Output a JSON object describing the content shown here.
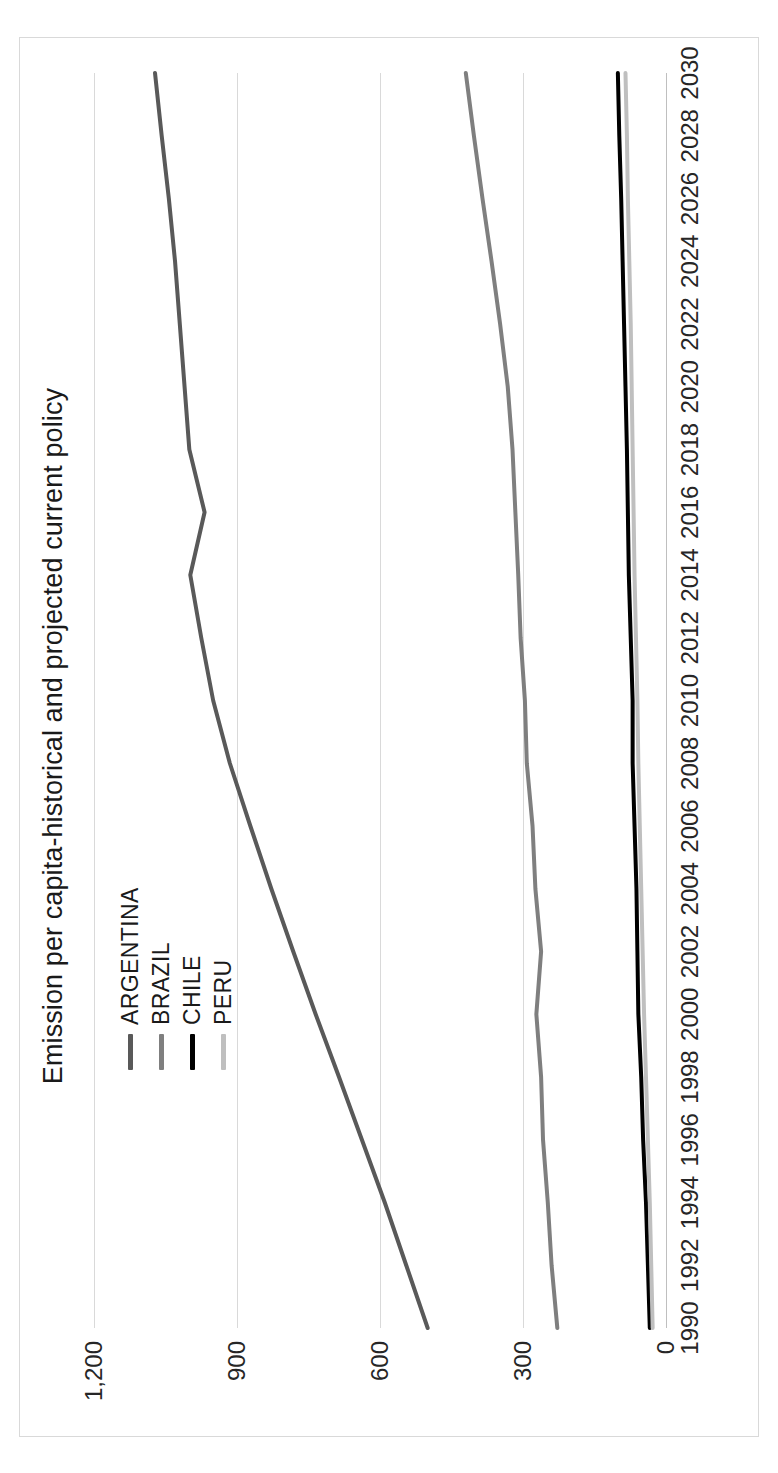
{
  "chart_data": {
    "type": "line",
    "title": "Emission per capita-historical and projected current policy",
    "xlabel": "",
    "ylabel": "",
    "xlim": [
      1990,
      2030
    ],
    "ylim": [
      0,
      1200
    ],
    "grid": true,
    "legend_position": "inside-upper-left",
    "y_ticks": [
      "0",
      "300",
      "600",
      "900",
      "1,200"
    ],
    "y_tick_values": [
      0,
      300,
      600,
      900,
      1200
    ],
    "x_ticks": [
      "1990",
      "1992",
      "1994",
      "1996",
      "1998",
      "2000",
      "2002",
      "2004",
      "2006",
      "2008",
      "2010",
      "2012",
      "2014",
      "2016",
      "2018",
      "2020",
      "2022",
      "2024",
      "2026",
      "2028",
      "2030"
    ],
    "x": [
      1990,
      1992,
      1994,
      1996,
      1998,
      2000,
      2002,
      2004,
      2006,
      2008,
      2010,
      2012,
      2014,
      2016,
      2018,
      2020,
      2022,
      2024,
      2026,
      2028,
      2030
    ],
    "colors": {
      "argentina": "#595959",
      "brazil": "#7f7f7f",
      "chile": "#000000",
      "peru": "#bfbfbf"
    },
    "series": [
      {
        "name": "ARGENTINA",
        "color": "#595959",
        "width": 4,
        "values": [
          500,
          545,
          590,
          638,
          686,
          735,
          782,
          828,
          872,
          915,
          950,
          975,
          998,
          968,
          1000,
          1010,
          1020,
          1030,
          1043,
          1058,
          1072
        ]
      },
      {
        "name": "BRAZIL",
        "color": "#7f7f7f",
        "width": 4,
        "values": [
          228,
          240,
          248,
          258,
          262,
          272,
          262,
          274,
          280,
          292,
          296,
          305,
          310,
          316,
          322,
          332,
          348,
          366,
          385,
          403,
          420
        ]
      },
      {
        "name": "CHILE",
        "color": "#000000",
        "width": 4,
        "values": [
          34,
          38,
          42,
          48,
          52,
          58,
          60,
          62,
          66,
          70,
          70,
          74,
          78,
          80,
          82,
          85,
          88,
          91,
          94,
          98,
          101
        ]
      },
      {
        "name": "PERU",
        "color": "#bfbfbf",
        "width": 4,
        "values": [
          28,
          31,
          34,
          38,
          42,
          46,
          49,
          52,
          55,
          58,
          60,
          63,
          66,
          68,
          70,
          72,
          74,
          77,
          80,
          82,
          85
        ]
      }
    ]
  },
  "legend": {
    "items": [
      {
        "label": "ARGENTINA",
        "color": "#595959"
      },
      {
        "label": "BRAZIL",
        "color": "#7f7f7f"
      },
      {
        "label": "CHILE",
        "color": "#000000"
      },
      {
        "label": "PERU",
        "color": "#bfbfbf"
      }
    ]
  }
}
